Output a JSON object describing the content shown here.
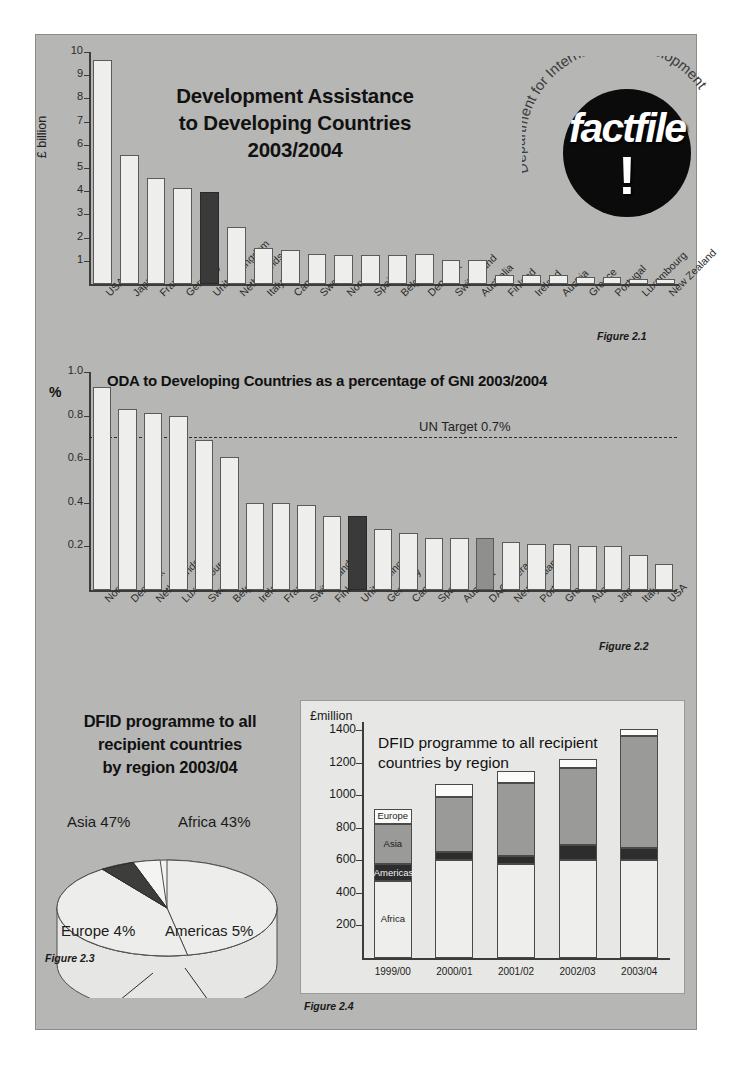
{
  "document": {
    "logo": {
      "brand": "factfile",
      "exclamation": "!",
      "ring_text": "Department for International Development"
    }
  },
  "figure21": {
    "caption": "Figure 2.1",
    "chart_data": {
      "type": "bar",
      "title": "Development Assistance to Developing Countries 2003/2004",
      "title_lines": [
        "Development Assistance",
        "to Developing Countries",
        "2003/2004"
      ],
      "xlabel": "",
      "ylabel": "£ billion",
      "ylim": [
        0,
        10
      ],
      "yticks": [
        1,
        2,
        3,
        4,
        5,
        6,
        7,
        8,
        9,
        10
      ],
      "ytick_labels": [
        "1",
        "2",
        "3",
        "4",
        "5",
        "6",
        "7",
        "8",
        "9",
        "10"
      ],
      "grid": false,
      "highlight_category": "United Kingdom",
      "highlight_color": "#3a3a3a",
      "bar_color": "#eeeeec",
      "categories": [
        "USA",
        "Japan",
        "France",
        "Germany",
        "United Kingdom",
        "Netherlands",
        "Italy",
        "Canada",
        "Sweden",
        "Norway",
        "Spain",
        "Belgium",
        "Denmark",
        "Switzerland",
        "Australia",
        "Finland",
        "Ireland",
        "Austria",
        "Greece",
        "Portugal",
        "Luxembourg",
        "New Zealand"
      ],
      "values": [
        9.65,
        5.55,
        4.55,
        4.15,
        3.95,
        2.45,
        1.55,
        1.45,
        1.3,
        1.25,
        1.25,
        1.25,
        1.3,
        1.05,
        1.05,
        0.4,
        0.4,
        0.4,
        0.3,
        0.3,
        0.2,
        0.2
      ]
    }
  },
  "figure22": {
    "caption": "Figure 2.2",
    "axis_unit": "%",
    "target_label": "UN Target 0.7%",
    "chart_data": {
      "type": "bar",
      "title": "ODA to Developing Countries as a percentage of GNI 2003/2004",
      "xlabel": "",
      "ylabel": "%",
      "ylim": [
        0,
        1.0
      ],
      "yticks": [
        0.2,
        0.4,
        0.6,
        0.8,
        1.0
      ],
      "ytick_labels": [
        "0.2",
        "0.4",
        "0.6",
        "0.8",
        "1.0"
      ],
      "grid": false,
      "reference_line": {
        "label": "UN Target 0.7%",
        "value": 0.7,
        "style": "dashed"
      },
      "highlight_category": "United Kingdom",
      "highlight_color": "#3a3a3a",
      "secondary_highlight_category": "DAC Average",
      "secondary_highlight_color": "#8f8f8d",
      "bar_color": "#eeeeec",
      "categories": [
        "Norway",
        "Denmark",
        "Netherlands",
        "Luxembourg",
        "Sweden",
        "Belgium",
        "Ireland",
        "France",
        "Switzerland",
        "Finland",
        "United Kingdom",
        "Germany",
        "Canada",
        "Spain",
        "Australia",
        "DAC Average",
        "New Zealand",
        "Portugal",
        "Greece",
        "Austria",
        "Japan",
        "Italy",
        "USA"
      ],
      "values": [
        0.93,
        0.83,
        0.81,
        0.8,
        0.69,
        0.61,
        0.4,
        0.4,
        0.39,
        0.34,
        0.34,
        0.28,
        0.26,
        0.24,
        0.24,
        0.24,
        0.22,
        0.21,
        0.21,
        0.2,
        0.2,
        0.16,
        0.12
      ]
    }
  },
  "figure23": {
    "caption": "Figure 2.3",
    "chart_data": {
      "type": "pie",
      "title": "DFID programme to all recipient countries by region 2003/04",
      "title_lines": [
        "DFID programme to all",
        "recipient countries",
        "by region 2003/04"
      ],
      "labels": [
        "Asia",
        "Africa",
        "Americas",
        "Europe"
      ],
      "values": [
        47,
        43,
        5,
        4
      ],
      "value_labels": [
        "Asia 47%",
        "Africa 43%",
        "Americas 5%",
        "Europe 4%"
      ],
      "unit": "%",
      "legend": "none"
    }
  },
  "figure24": {
    "caption": "Figure 2.4",
    "chart_data": {
      "type": "bar",
      "subtype": "stacked",
      "title": "DFID programme to all recipient countries by region",
      "title_lines": [
        "DFID programme to all recipient",
        "countries by region"
      ],
      "xlabel": "",
      "ylabel": "£million",
      "ylim": [
        0,
        1450
      ],
      "yticks": [
        200,
        400,
        600,
        800,
        1000,
        1200,
        1400
      ],
      "ytick_labels": [
        "200",
        "400",
        "600",
        "800",
        "1000",
        "1200",
        "1400"
      ],
      "grid": false,
      "categories": [
        "1999/00",
        "2000/01",
        "2001/02",
        "2002/03",
        "2003/04"
      ],
      "series": [
        {
          "name": "Africa",
          "color": "#eeeeec",
          "values": [
            475,
            600,
            575,
            605,
            600
          ]
        },
        {
          "name": "Americas",
          "color": "#2d2d2d",
          "values": [
            100,
            50,
            50,
            90,
            75
          ]
        },
        {
          "name": "Asia",
          "color": "#9a9a98",
          "values": [
            250,
            340,
            450,
            475,
            690
          ]
        },
        {
          "name": "Europe",
          "color": "#fbfbf9",
          "values": [
            90,
            80,
            75,
            55,
            40
          ]
        }
      ],
      "totals": [
        915,
        1070,
        1150,
        1225,
        1405
      ]
    }
  }
}
